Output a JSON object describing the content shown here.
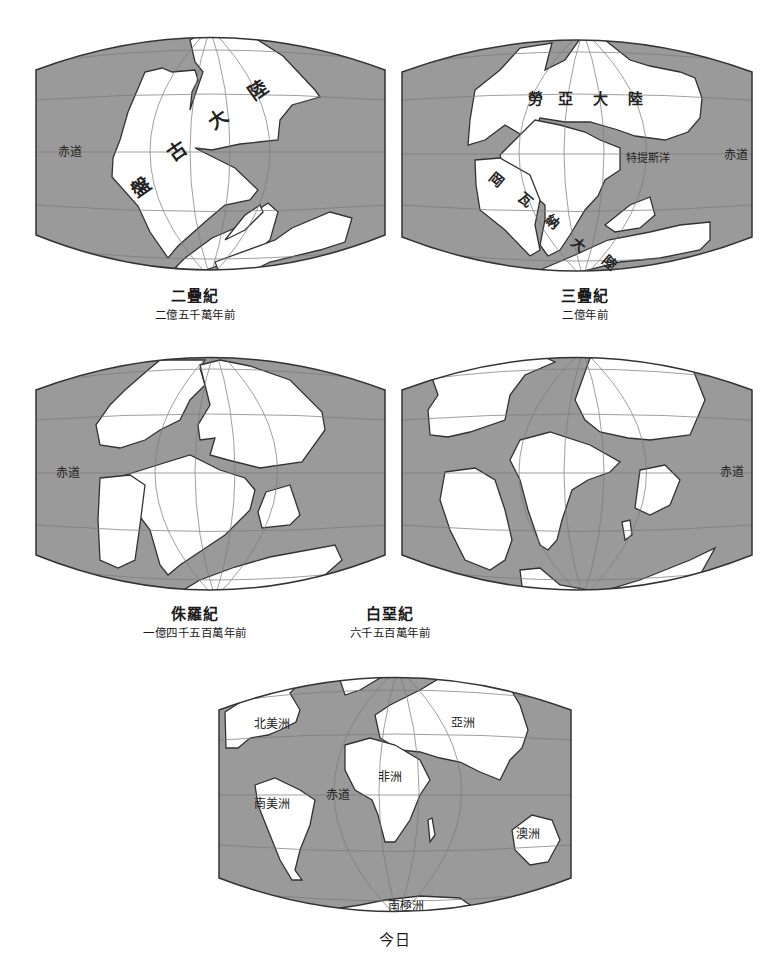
{
  "colors": {
    "ocean": "#9a9a9a",
    "land": "#ffffff",
    "outline": "#333333",
    "grid": "#7a7a7a",
    "grid_on_land": "#aaaaaa",
    "text": "#1a1a1a"
  },
  "panels": [
    {
      "id": "permian",
      "title": "二疊紀",
      "subtitle": "二億五千萬年前",
      "labels": [
        {
          "text": "赤道",
          "x": 70,
          "y": 156,
          "size": 12,
          "rotate": 0
        },
        {
          "text": "盤",
          "x": 145,
          "y": 193,
          "size": 19,
          "rotate": -35
        },
        {
          "text": "古",
          "x": 181,
          "y": 157,
          "size": 19,
          "rotate": -35
        },
        {
          "text": "大",
          "x": 222,
          "y": 125,
          "size": 19,
          "rotate": -35
        },
        {
          "text": "陸",
          "x": 262,
          "y": 96,
          "size": 19,
          "rotate": -35
        }
      ],
      "land": [
        "M190,40 L208,30 L250,35 L283,56 L315,90 L320,97 L292,105 L280,120 L278,140 L240,144 L212,150 L195,148 L235,168 L258,190 L250,200 L225,205 L212,216 L205,222 L178,246 L168,258 L150,232 L138,206 L112,177 L113,158 L120,140 L128,112 L145,72 L162,68 L172,72 L195,70 L198,80 L192,92 L190,110 L195,95 L203,72 L195,62 Z",
        "M175,268 L185,258 L212,238 L240,226 L255,212 L268,203 L278,212 L270,240 L258,250 L220,265 L200,272 Z",
        "M215,262 L275,240 L292,228 L330,212 L352,218 L345,242 L320,250 L270,262 L250,272 L220,275 Z",
        "M225,240 L245,215 L260,205 L263,212 L245,230 Z"
      ]
    },
    {
      "id": "triassic",
      "title": "三疊紀",
      "subtitle": "二億年前",
      "labels": [
        {
          "text": "赤道",
          "x": 736,
          "y": 159,
          "size": 12,
          "rotate": 0
        },
        {
          "text": "勞",
          "x": 535,
          "y": 104,
          "size": 15,
          "rotate": 0
        },
        {
          "text": "亞",
          "x": 565,
          "y": 104,
          "size": 15,
          "rotate": 0
        },
        {
          "text": "大",
          "x": 600,
          "y": 104,
          "size": 15,
          "rotate": 0
        },
        {
          "text": "陸",
          "x": 635,
          "y": 104,
          "size": 15,
          "rotate": 0
        },
        {
          "text": "特提斯洋",
          "x": 648,
          "y": 162,
          "size": 11,
          "rotate": 0
        },
        {
          "text": "岡",
          "x": 493,
          "y": 183,
          "size": 14,
          "rotate": 40
        },
        {
          "text": "瓦",
          "x": 522,
          "y": 203,
          "size": 14,
          "rotate": 40
        },
        {
          "text": "納",
          "x": 549,
          "y": 225,
          "size": 14,
          "rotate": 40
        },
        {
          "text": "大",
          "x": 575,
          "y": 248,
          "size": 14,
          "rotate": 40
        },
        {
          "text": "陸",
          "x": 606,
          "y": 266,
          "size": 14,
          "rotate": 40
        }
      ],
      "land": [
        "M475,90 L500,70 L520,48 L552,43 L548,58 L545,70 L565,60 L582,36 L605,40 L630,60 L650,66 L680,72 L695,78 L702,98 L700,118 L688,132 L665,140 L635,136 L618,130 L590,122 L565,122 L540,118 L530,140 L505,125 L485,140 L468,145 L470,120 Z",
        "M515,140 L535,120 L560,125 L585,132 L600,140 L620,148 L620,170 L605,180 L598,196 L585,210 L570,235 L560,250 L548,256 L540,245 L545,220 L545,205 L528,190 L505,175 L500,155 Z",
        "M475,160 L500,158 L530,175 L540,200 L535,225 L540,250 L530,256 L505,230 L480,210 L476,185 Z",
        "M540,270 L575,255 L608,240 L650,232 L680,225 L710,222 L710,240 L700,250 L660,258 L620,262 L580,272 L545,278 Z",
        "M605,225 L630,205 L650,197 L655,215 L640,228 L615,232 Z"
      ]
    },
    {
      "id": "jurassic",
      "title": "侏羅紀",
      "subtitle": "一億四千五百萬年前",
      "labels": [
        {
          "text": "赤道",
          "x": 68,
          "y": 477,
          "size": 12,
          "rotate": 0
        }
      ],
      "land": [
        "M148,370 L160,360 L205,360 L200,368 L205,385 L190,400 L180,420 L160,430 L145,440 L120,448 L100,445 L96,425 L110,405 L125,390 Z",
        "M200,365 L220,360 L250,366 L290,380 L322,412 L325,430 L302,462 L260,468 L228,460 L210,455 L215,438 L200,440 L198,425 L210,405 Z",
        "M148,468 L190,455 L220,470 L245,478 L255,490 L250,510 L240,520 L225,535 L210,545 L180,565 L168,575 L160,565 L150,530 L135,510 L112,495 L110,480 Z",
        "M266,492 L290,485 L300,515 L290,525 L262,528 L258,512 Z",
        "M175,595 L200,580 L235,567 L270,557 L335,545 L342,560 L325,575 L290,585 L250,595 L210,598 Z",
        "M100,478 L130,475 L145,485 L140,525 L135,560 L118,568 L100,560 L98,520 Z"
      ]
    },
    {
      "id": "cretaceous",
      "title": "白堊紀",
      "subtitle": "六千五百萬年前",
      "labels": [
        {
          "text": "赤道",
          "x": 732,
          "y": 476,
          "size": 12,
          "rotate": 0
        }
      ],
      "land": [
        "M430,372 L490,360 L540,355 L555,362 L525,375 L510,395 L505,420 L470,432 L448,437 L430,435 L428,410 L438,395 Z",
        "M590,358 L640,350 L690,362 L705,400 L690,435 L650,440 L628,438 L600,432 L585,420 L575,400 Z",
        "M520,440 L550,432 L590,445 L620,462 L610,472 L588,480 L572,490 L562,520 L557,540 L548,550 L540,545 L528,510 L520,480 L510,460 Z",
        "M445,472 L475,468 L495,480 L505,510 L512,540 L505,560 L490,570 L465,560 L450,530 L440,500 Z",
        "M640,470 L665,465 L680,480 L670,505 L650,515 L635,508 Z",
        "M520,570 L540,568 L560,585 L600,592 L640,580 L690,560 L715,548 L700,575 L650,590 L600,600 L560,608 L525,610 Z",
        "M622,522 L630,520 L632,535 L625,540 Z"
      ]
    },
    {
      "id": "today",
      "title": "今日",
      "subtitle": "",
      "labels": [
        {
          "text": "北美洲",
          "x": 272,
          "y": 728,
          "size": 12,
          "rotate": 0
        },
        {
          "text": "亞洲",
          "x": 463,
          "y": 727,
          "size": 12,
          "rotate": 0
        },
        {
          "text": "非洲",
          "x": 390,
          "y": 781,
          "size": 12,
          "rotate": 0
        },
        {
          "text": "赤道",
          "x": 338,
          "y": 799,
          "size": 12,
          "rotate": 0
        },
        {
          "text": "南美洲",
          "x": 272,
          "y": 808,
          "size": 12,
          "rotate": 0
        },
        {
          "text": "澳洲",
          "x": 528,
          "y": 838,
          "size": 12,
          "rotate": 0
        },
        {
          "text": "南極洲",
          "x": 406,
          "y": 910,
          "size": 12,
          "rotate": 0
        }
      ],
      "land": [
        "M225,712 L250,696 L275,688 L300,683 L290,693 L300,710 L296,722 L280,730 L268,735 L250,738 L238,748 L226,748 Z",
        "M340,680 L365,672 L385,675 L360,690 L345,695 Z",
        "M375,715 L390,705 L420,690 L440,678 L480,675 L510,688 L520,705 L528,730 L522,748 L510,760 L500,780 L480,772 L460,762 L440,758 L420,752 L400,750 L380,738 Z",
        "M345,745 L370,738 L395,745 L420,760 L430,780 L420,795 L410,820 L395,842 L385,842 L378,815 L372,800 L355,790 L345,770 Z",
        "M255,785 L275,778 L300,790 L315,800 L310,825 L300,850 L295,870 L302,880 L292,880 L280,860 L268,830 L258,805 Z",
        "M512,830 L532,815 L552,820 L560,840 L548,862 L530,865 L515,850 Z",
        "M328,910 L360,905 L385,900 L420,896 L460,898 L470,905 L440,912 L380,916 L335,916 Z",
        "M428,820 L432,818 L435,835 L430,842 Z"
      ]
    }
  ]
}
